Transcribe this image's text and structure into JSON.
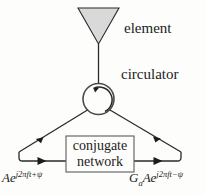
{
  "figure": {
    "background_color": "#fdfdfb",
    "line_color": "#1c1c1c",
    "element_fill_color": "#d9d9d9"
  },
  "labels": {
    "element": "element",
    "circulator": "circulator"
  },
  "box": {
    "line1": "conjugate",
    "line2": "network"
  },
  "signals": {
    "left": {
      "base": "Ae",
      "exponent": "j2πft+ψ"
    },
    "right": {
      "gain": "G",
      "gain_subscript": "a",
      "base": "Ae",
      "exponent": "j2πft−ψ"
    }
  },
  "shapes": {
    "element_icon": "triangle-antenna",
    "circulator_icon": "circle-with-ccw-arrow"
  }
}
